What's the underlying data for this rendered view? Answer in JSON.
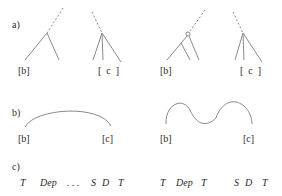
{
  "panels": {
    "a": {
      "label": "a)",
      "trees": [
        {
          "leaf_label": "[b]"
        },
        {
          "leaf_label": "[  c  ]"
        },
        {
          "leaf_label": "[b]"
        },
        {
          "leaf_label": "[  c  ]"
        }
      ]
    },
    "b": {
      "label": "b)",
      "left": {
        "start_label": "[b]",
        "end_label": "[c]",
        "curve": "single-arc"
      },
      "right": {
        "start_label": "[b]",
        "end_label": "[c]",
        "curve": "wavy"
      }
    },
    "c": {
      "label": "c)",
      "left_sequence": [
        "T",
        "Dep",
        ". . .",
        "S",
        "D",
        "T"
      ],
      "right_sequence": [
        "T",
        "Dep",
        "T",
        "S",
        "D",
        "T"
      ]
    }
  },
  "colors": {
    "line": "#8a8a8a",
    "text": "#2a2a2a"
  }
}
